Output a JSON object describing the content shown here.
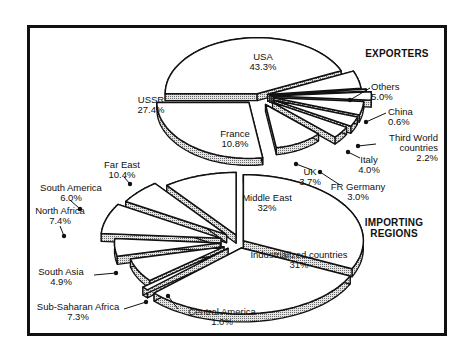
{
  "chart_data": [
    {
      "type": "pie",
      "title": "EXPORTERS",
      "style": "3d-exploded",
      "slices": [
        {
          "label": "USA",
          "value": 43.3
        },
        {
          "label": "Others",
          "value": 5.0
        },
        {
          "label": "China",
          "value": 0.6
        },
        {
          "label": "Third World countries",
          "value": 2.2
        },
        {
          "label": "Italy",
          "value": 4.0
        },
        {
          "label": "FR Germany",
          "value": 3.0
        },
        {
          "label": "UK",
          "value": 3.7
        },
        {
          "label": "France",
          "value": 10.8
        },
        {
          "label": "USSR",
          "value": 27.4
        }
      ]
    },
    {
      "type": "pie",
      "title": "IMPORTING REGIONS",
      "style": "3d-exploded",
      "slices": [
        {
          "label": "Middle East",
          "value": 32
        },
        {
          "label": "Industrialized countries",
          "value": 31
        },
        {
          "label": "Central America",
          "value": 1.0
        },
        {
          "label": "Sub-Saharan Africa",
          "value": 7.3
        },
        {
          "label": "South Asia",
          "value": 4.9
        },
        {
          "label": "North Africa",
          "value": 7.4
        },
        {
          "label": "South America",
          "value": 6.0
        },
        {
          "label": "Far East",
          "value": 10.4
        }
      ]
    }
  ],
  "headings": {
    "exporters": "EXPORTERS",
    "importing_line1": "IMPORTING",
    "importing_line2": "REGIONS"
  },
  "labels": {
    "usa": {
      "name": "USA",
      "pct": "43.3%"
    },
    "ussr": {
      "name": "USSR",
      "pct": "27.4%"
    },
    "france": {
      "name": "France",
      "pct": "10.8%"
    },
    "others": {
      "name": "Others",
      "pct": "5.0%"
    },
    "china": {
      "name": "China",
      "pct": "0.6%"
    },
    "third_world": {
      "name1": "Third World",
      "name2": "countries",
      "pct": "2.2%"
    },
    "italy": {
      "name": "Italy",
      "pct": "4.0%"
    },
    "fr_germany": {
      "name": "FR Germany",
      "pct": "3.0%"
    },
    "uk": {
      "name": "UK",
      "pct": "3.7%"
    },
    "middle_east": {
      "name": "Middle East",
      "pct": "32%"
    },
    "industrialized": {
      "name": "Industrialized countries",
      "pct": "31%"
    },
    "central_america": {
      "name": "Central America",
      "pct": "1.0%"
    },
    "sub_saharan": {
      "name": "Sub-Saharan Africa",
      "pct": "7.3%"
    },
    "south_asia": {
      "name": "South Asia",
      "pct": "4.9%"
    },
    "north_africa": {
      "name": "North Africa",
      "pct": "7.4%"
    },
    "south_america": {
      "name": "South America",
      "pct": "6.0%"
    },
    "far_east": {
      "name": "Far East",
      "pct": "10.4%"
    }
  },
  "colors": {
    "ink": "#111111",
    "face": "#ffffff",
    "side": "#bdbdbd"
  }
}
